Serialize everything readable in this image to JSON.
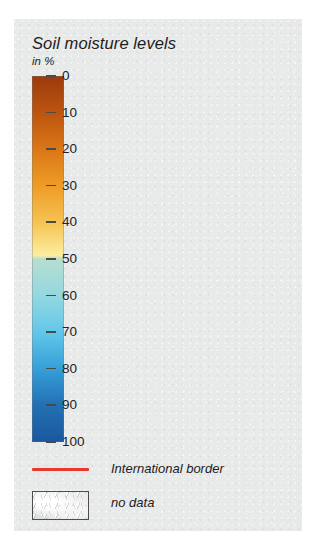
{
  "legend": {
    "title": "Soil moisture levels",
    "subtitle": "in %",
    "border_item": {
      "label": "International border",
      "color": "#e8392a"
    },
    "nodata_item": {
      "label": "no data",
      "swatch_name": "hatched-grey-texture"
    }
  },
  "chart_data": {
    "type": "colorbar",
    "title": "Soil moisture levels",
    "subtitle": "in %",
    "unit": "%",
    "orientation": "vertical",
    "axis_direction": "top-to-bottom",
    "ylim": [
      0,
      100
    ],
    "tick_step": 10,
    "tick_labels": [
      "0",
      "10",
      "20",
      "30",
      "40",
      "50",
      "60",
      "70",
      "80",
      "90",
      "100"
    ],
    "tick_values": [
      0,
      10,
      20,
      30,
      40,
      50,
      60,
      70,
      80,
      90,
      100
    ],
    "grid": false,
    "legend_position": "below-colorbar",
    "color_stops": [
      {
        "value": 0,
        "color": "#9c3a0c"
      },
      {
        "value": 10,
        "color": "#bc5410"
      },
      {
        "value": 20,
        "color": "#da7717"
      },
      {
        "value": 30,
        "color": "#ee9c26"
      },
      {
        "value": 40,
        "color": "#f6c353"
      },
      {
        "value": 49,
        "color": "#fbeea0"
      },
      {
        "value": 50,
        "color": "#b6ded0"
      },
      {
        "value": 60,
        "color": "#94d8e0"
      },
      {
        "value": 70,
        "color": "#62c7ea"
      },
      {
        "value": 80,
        "color": "#359fd8"
      },
      {
        "value": 90,
        "color": "#2370b4"
      },
      {
        "value": 100,
        "color": "#1a579e"
      }
    ],
    "discontinuity_at": 50,
    "annotations": [
      "International border",
      "no data"
    ]
  }
}
